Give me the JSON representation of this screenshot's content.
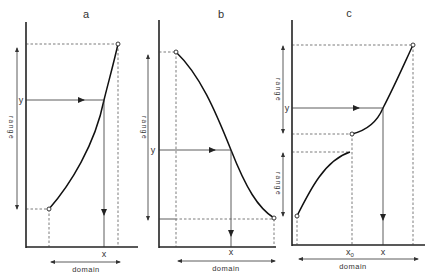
{
  "figure": {
    "panels": [
      {
        "id": "a",
        "title": "a",
        "x_label": "x",
        "y_label": "y",
        "range_label": "range",
        "domain_label": "domain",
        "function_type": "monotone increasing, continuous"
      },
      {
        "id": "b",
        "title": "b",
        "x_label": "x",
        "y_label": "y",
        "range_label": "range",
        "right_range_labels": [
          "range",
          "range"
        ],
        "domain_label": "domain",
        "function_type": "monotone decreasing, continuous"
      },
      {
        "id": "c",
        "title": "c",
        "x_label": "x",
        "x0_label": "x",
        "x0_subscript": "0",
        "y_label": "y",
        "range_labels": [
          "range",
          "range"
        ],
        "domain_label": "domain",
        "function_type": "monotone increasing, discontinuous at x0"
      }
    ]
  }
}
